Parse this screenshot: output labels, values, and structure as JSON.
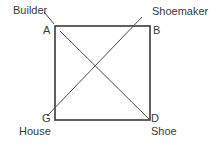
{
  "diagram": {
    "title": "",
    "square": {
      "x": 55,
      "y": 26,
      "width": 95,
      "height": 94,
      "stroke": "#3a3a3a",
      "stroke_width": 1.6
    },
    "line_color": "#4a4a4a",
    "vertices": {
      "A": {
        "label": "A",
        "role": "top-left"
      },
      "B": {
        "label": "B",
        "role": "top-right"
      },
      "G": {
        "label": "G",
        "role": "bottom-left"
      },
      "D": {
        "label": "D",
        "role": "bottom-right"
      }
    },
    "terms": {
      "builder": "Builder",
      "shoemaker": "Shoemaker",
      "house": "House",
      "shoe": "Shoe"
    },
    "lines": [
      {
        "name": "diagonal-A-D",
        "from": "A",
        "to": "D"
      },
      {
        "name": "diagonal-G-shoemaker",
        "from": "G",
        "to": "Shoemaker"
      },
      {
        "name": "builder-pointer",
        "from": "Builder",
        "to": "A"
      }
    ]
  }
}
